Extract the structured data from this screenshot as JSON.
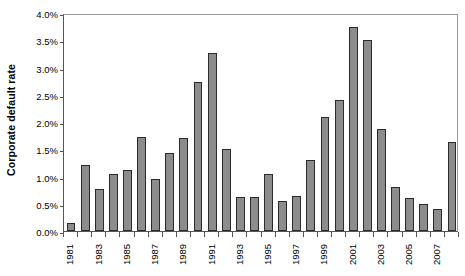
{
  "chart_data": {
    "type": "bar",
    "title": "",
    "subtitle": "",
    "xlabel": "",
    "ylabel": "Corporate default rate",
    "ylim": [
      0,
      4.0
    ],
    "ytick_values": [
      0.0,
      0.5,
      1.0,
      1.5,
      2.0,
      2.5,
      3.0,
      3.5,
      4.0
    ],
    "ytick_labels": [
      "0.0%",
      "0.5%",
      "1.0%",
      "1.5%",
      "2.0%",
      "2.5%",
      "3.0%",
      "3.5%",
      "4.0%"
    ],
    "grid": false,
    "legend": null,
    "legend_position": "none",
    "bar_color": "#8c8c8c",
    "bar_edge_color": "#2b2b2b",
    "axis_color": "#555555",
    "categories": [
      "1981",
      "1982",
      "1983",
      "1984",
      "1985",
      "1986",
      "1987",
      "1988",
      "1989",
      "1990",
      "1991",
      "1992",
      "1993",
      "1994",
      "1995",
      "1996",
      "1997",
      "1998",
      "1999",
      "2000",
      "2001",
      "2002",
      "2003",
      "2004",
      "2005",
      "2006",
      "2007",
      "2008"
    ],
    "xtick_labels": [
      "1981",
      "1983",
      "1985",
      "1987",
      "1989",
      "1991",
      "1993",
      "1995",
      "1997",
      "1999",
      "2001",
      "2003",
      "2005",
      "2007"
    ],
    "values": [
      0.15,
      1.22,
      0.78,
      1.05,
      1.12,
      1.73,
      0.95,
      1.43,
      1.7,
      2.73,
      3.27,
      1.5,
      0.63,
      0.63,
      1.05,
      0.55,
      0.65,
      1.3,
      2.1,
      2.4,
      3.75,
      3.5,
      1.88,
      0.8,
      0.6,
      0.5,
      0.4,
      1.63
    ],
    "units": "percent"
  }
}
